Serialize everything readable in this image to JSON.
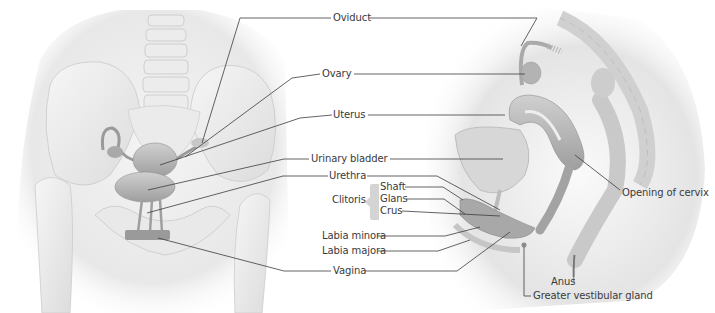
{
  "figure": {
    "type": "anatomical-illustration",
    "panels": [
      {
        "id": "frontal",
        "view": "Anterior view of female pelvis"
      },
      {
        "id": "sagittal",
        "view": "Midsagittal section of female pelvis"
      }
    ],
    "colors": {
      "background": "#ffffff",
      "label_text": "#3a3a3a",
      "leader_line": "#3c3c3c",
      "body_shadow": "#e6e6e6",
      "bone": "#eeeeee",
      "organ": "#b9b9b9",
      "bracket": "#d4d4d4"
    }
  },
  "labels": {
    "oviduct": "Oviduct",
    "ovary": "Ovary",
    "uterus": "Uterus",
    "urinary_bladder": "Urinary bladder",
    "urethra": "Urethra",
    "clitoris": "Clitoris",
    "clitoris_parts": {
      "shaft": "Shaft",
      "glans": "Glans",
      "crus": "Crus"
    },
    "labia_minora": "Labia minora",
    "labia_majora": "Labia majora",
    "vagina": "Vagina",
    "opening_of_cervix": "Opening of cervix",
    "anus": "Anus",
    "greater_vestibular_gland": "Greater vestibular gland"
  }
}
